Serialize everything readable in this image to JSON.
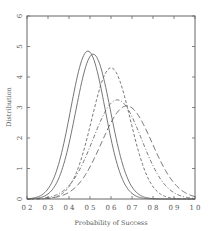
{
  "chart_data": {
    "type": "line",
    "title": "",
    "xlabel": "Probability of Success",
    "ylabel": "Distribution",
    "xlim": [
      0.2,
      1.0
    ],
    "ylim": [
      0,
      6
    ],
    "xticks": [
      "0.2",
      "0.3",
      "0.4",
      "0.5",
      "0.6",
      "0.7",
      "0.8",
      "0.9",
      "1.0"
    ],
    "yticks": [
      "0",
      "1",
      "2",
      "3",
      "4",
      "5",
      "6"
    ],
    "grid": false,
    "legend": null,
    "series": [
      {
        "name": "solid-1",
        "style": "solid",
        "mode": 0.49,
        "peak": 4.85,
        "sd": 0.082
      },
      {
        "name": "solid-2",
        "style": "solid",
        "mode": 0.515,
        "peak": 4.75,
        "sd": 0.083
      },
      {
        "name": "dashed-1",
        "style": "dashed",
        "mode": 0.6,
        "peak": 4.3,
        "sd": 0.092
      },
      {
        "name": "dashdot-1",
        "style": "dashdot",
        "mode": 0.63,
        "peak": 3.25,
        "sd": 0.115
      },
      {
        "name": "longdash-1",
        "style": "longdash",
        "mode": 0.675,
        "peak": 3.05,
        "sd": 0.12
      }
    ]
  }
}
